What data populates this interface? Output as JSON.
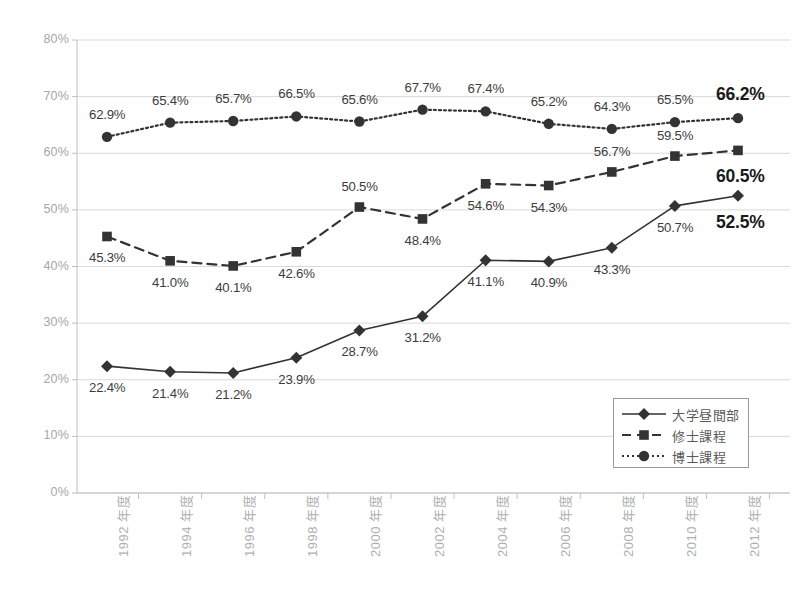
{
  "chart_data": {
    "type": "line",
    "title": "",
    "xlabel": "",
    "ylabel": "",
    "ylim": [
      0,
      80
    ],
    "yticks": [
      "0%",
      "10%",
      "20%",
      "30%",
      "40%",
      "50%",
      "60%",
      "70%",
      "80%"
    ],
    "ytick_values": [
      0,
      10,
      20,
      30,
      40,
      50,
      60,
      70,
      80
    ],
    "grid": true,
    "legend_position": "bottom-right",
    "categories": [
      "1992 年度",
      "1994 年度",
      "1996 年度",
      "1998 年度",
      "2000 年度",
      "2002 年度",
      "2004 年度",
      "2006 年度",
      "2008 年度",
      "2010 年度",
      "2012 年度"
    ],
    "series": [
      {
        "name": "大学昼間部",
        "marker": "diamond",
        "linestyle": "solid",
        "color": "#333333",
        "values": [
          22.4,
          21.4,
          21.2,
          23.9,
          28.7,
          31.2,
          41.1,
          40.9,
          43.3,
          50.7,
          52.5
        ],
        "labels": [
          "22.4%",
          "21.4%",
          "21.2%",
          "23.9%",
          "28.7%",
          "31.2%",
          "41.1%",
          "40.9%",
          "43.3%",
          "50.7%",
          "52.5%"
        ]
      },
      {
        "name": "修士課程",
        "marker": "square",
        "linestyle": "dashed",
        "color": "#333333",
        "values": [
          45.3,
          41.0,
          40.1,
          42.6,
          50.5,
          48.4,
          54.6,
          54.3,
          56.7,
          59.5,
          60.5
        ],
        "labels": [
          "45.3%",
          "41.0%",
          "40.1%",
          "42.6%",
          "50.5%",
          "48.4%",
          "54.6%",
          "54.3%",
          "56.7%",
          "59.5%",
          "60.5%"
        ]
      },
      {
        "name": "博士課程",
        "marker": "circle",
        "linestyle": "dotted",
        "color": "#333333",
        "values": [
          62.9,
          65.4,
          65.7,
          66.5,
          65.6,
          67.7,
          67.4,
          65.2,
          64.3,
          65.5,
          66.2
        ],
        "labels": [
          "62.9%",
          "65.4%",
          "65.7%",
          "66.5%",
          "65.6%",
          "67.7%",
          "67.4%",
          "65.2%",
          "64.3%",
          "65.5%",
          "66.2%"
        ]
      }
    ]
  },
  "colors": {
    "gridline": "#d9d9d9",
    "axis": "#bfbfbf",
    "tick_text": "#a6a6a6",
    "data_label": "#3d3d3d",
    "data_label_last": "#1a1a1a",
    "marker": "#333333",
    "legend_border": "#9a9a9a",
    "background": "#ffffff"
  }
}
